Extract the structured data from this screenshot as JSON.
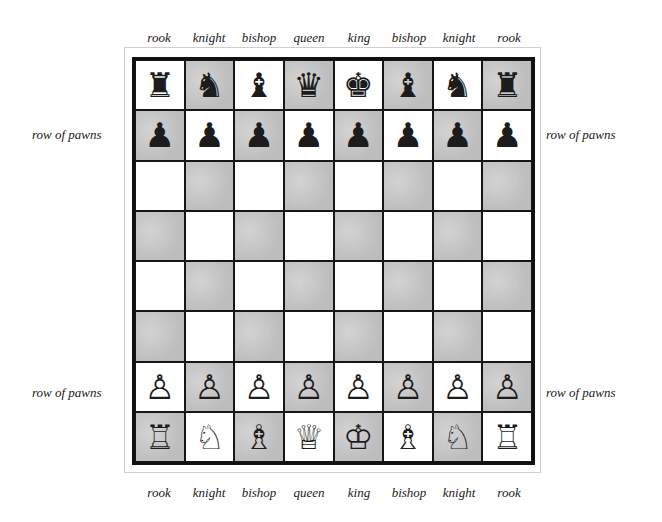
{
  "top_labels": [
    "rook",
    "knight",
    "bishop",
    "queen",
    "king",
    "bishop",
    "knight",
    "rook"
  ],
  "bottom_labels": [
    "rook",
    "knight",
    "bishop",
    "queen",
    "king",
    "bishop",
    "knight",
    "rook"
  ],
  "side_labels": {
    "left_top": "row of pawns",
    "right_top": "row of pawns",
    "left_bottom": "row of pawns",
    "right_bottom": "row of pawns"
  },
  "colors": {
    "light_square": "#ffffff",
    "dark_square": "#c9c9c9",
    "line": "#161616"
  },
  "board": {
    "top_left_square": "light",
    "rows": [
      [
        {
          "piece": "rook",
          "color": "black",
          "glyph": "♜"
        },
        {
          "piece": "knight",
          "color": "black",
          "glyph": "♞"
        },
        {
          "piece": "bishop",
          "color": "black",
          "glyph": "♝"
        },
        {
          "piece": "queen",
          "color": "black",
          "glyph": "♛"
        },
        {
          "piece": "king",
          "color": "black",
          "glyph": "♚"
        },
        {
          "piece": "bishop",
          "color": "black",
          "glyph": "♝"
        },
        {
          "piece": "knight",
          "color": "black",
          "glyph": "♞"
        },
        {
          "piece": "rook",
          "color": "black",
          "glyph": "♜"
        }
      ],
      [
        {
          "piece": "pawn",
          "color": "black",
          "glyph": "♟"
        },
        {
          "piece": "pawn",
          "color": "black",
          "glyph": "♟"
        },
        {
          "piece": "pawn",
          "color": "black",
          "glyph": "♟"
        },
        {
          "piece": "pawn",
          "color": "black",
          "glyph": "♟"
        },
        {
          "piece": "pawn",
          "color": "black",
          "glyph": "♟"
        },
        {
          "piece": "pawn",
          "color": "black",
          "glyph": "♟"
        },
        {
          "piece": "pawn",
          "color": "black",
          "glyph": "♟"
        },
        {
          "piece": "pawn",
          "color": "black",
          "glyph": "♟"
        }
      ],
      [
        null,
        null,
        null,
        null,
        null,
        null,
        null,
        null
      ],
      [
        null,
        null,
        null,
        null,
        null,
        null,
        null,
        null
      ],
      [
        null,
        null,
        null,
        null,
        null,
        null,
        null,
        null
      ],
      [
        null,
        null,
        null,
        null,
        null,
        null,
        null,
        null
      ],
      [
        {
          "piece": "pawn",
          "color": "white",
          "glyph": "♙"
        },
        {
          "piece": "pawn",
          "color": "white",
          "glyph": "♙"
        },
        {
          "piece": "pawn",
          "color": "white",
          "glyph": "♙"
        },
        {
          "piece": "pawn",
          "color": "white",
          "glyph": "♙"
        },
        {
          "piece": "pawn",
          "color": "white",
          "glyph": "♙"
        },
        {
          "piece": "pawn",
          "color": "white",
          "glyph": "♙"
        },
        {
          "piece": "pawn",
          "color": "white",
          "glyph": "♙"
        },
        {
          "piece": "pawn",
          "color": "white",
          "glyph": "♙"
        }
      ],
      [
        {
          "piece": "rook",
          "color": "white",
          "glyph": "♖"
        },
        {
          "piece": "knight",
          "color": "white",
          "glyph": "♘"
        },
        {
          "piece": "bishop",
          "color": "white",
          "glyph": "♗"
        },
        {
          "piece": "queen",
          "color": "white",
          "glyph": "♕"
        },
        {
          "piece": "king",
          "color": "white",
          "glyph": "♔"
        },
        {
          "piece": "bishop",
          "color": "white",
          "glyph": "♗"
        },
        {
          "piece": "knight",
          "color": "white",
          "glyph": "♘"
        },
        {
          "piece": "rook",
          "color": "white",
          "glyph": "♖"
        }
      ]
    ]
  }
}
